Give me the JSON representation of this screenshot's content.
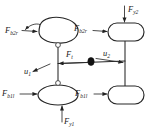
{
  "diagram": {
    "type": "free-body-diagram",
    "title": "",
    "background_color": "#ffffff",
    "line_color": "#262626",
    "label_color": "#1a1a1a",
    "bodies": [
      {
        "id": "top-left-body",
        "name": "upper left link body",
        "cx": 58,
        "cy": 32,
        "rx": 20,
        "ry": 11
      },
      {
        "id": "bottom-left-body",
        "name": "lower left link body",
        "cx": 58,
        "cy": 95,
        "rx": 20,
        "ry": 10
      },
      {
        "id": "top-right-body",
        "name": "upper right link body",
        "cx": 126,
        "cy": 32,
        "rx": 18,
        "ry": 9
      },
      {
        "id": "bottom-right-body",
        "name": "lower right link body",
        "cx": 126,
        "cy": 95,
        "rx": 18,
        "ry": 9
      }
    ],
    "joints": [
      {
        "id": "joint-upper",
        "kind": "revolute-open",
        "cx": 58,
        "cy": 45
      },
      {
        "id": "joint-lower",
        "kind": "revolute-open",
        "cx": 58,
        "cy": 83
      },
      {
        "id": "joint-pivot",
        "kind": "pin-filled",
        "cx": 91,
        "cy": 61
      }
    ],
    "labels": {
      "force_b2r_left": {
        "base": "F",
        "sub": "b2r",
        "x": 5,
        "y": 33
      },
      "force_b1l_left": {
        "base": "F",
        "sub": "b1l",
        "x": 3,
        "y": 96
      },
      "force_b2r_right": {
        "base": "F",
        "sub": "b2r",
        "x": 74,
        "y": 31
      },
      "force_b1l_right": {
        "base": "F",
        "sub": "b1l",
        "x": 75,
        "y": 96
      },
      "force_y2_top": {
        "base": "F",
        "sub": "y2",
        "x": 129,
        "y": 11
      },
      "force_y1_bottom": {
        "base": "F",
        "sub": "y1",
        "x": 62,
        "y": 124
      },
      "force_t_center": {
        "base": "F",
        "sub": "t",
        "x": 66,
        "y": 56
      },
      "disp_u1": {
        "base": "u",
        "sub": "1",
        "x": 24,
        "y": 73
      },
      "disp_u2": {
        "base": "u",
        "sub": "2",
        "x": 104,
        "y": 56
      }
    },
    "vectors": [
      {
        "name": "F_b2r-left-arrow",
        "from": [
          22,
          31
        ],
        "to": [
          37,
          32
        ],
        "direction": "right"
      },
      {
        "name": "F_b1l-left-arrow",
        "from": [
          20,
          94
        ],
        "to": [
          37,
          94
        ],
        "direction": "right"
      },
      {
        "name": "F_b2r-right-arrow",
        "from": [
          93,
          30
        ],
        "to": [
          108,
          31
        ],
        "direction": "right"
      },
      {
        "name": "F_b1l-right-arrow",
        "from": [
          94,
          94
        ],
        "to": [
          108,
          94
        ],
        "direction": "right"
      },
      {
        "name": "F_y2-down-arrow",
        "from": [
          124,
          7
        ],
        "to": [
          124,
          23
        ],
        "direction": "down"
      },
      {
        "name": "F_y1-up-arrow",
        "from": [
          62,
          122
        ],
        "to": [
          62,
          105
        ],
        "direction": "up"
      },
      {
        "name": "F_t-left-arrow",
        "from": [
          88,
          62
        ],
        "to": [
          58,
          63
        ],
        "direction": "left"
      },
      {
        "name": "u1-arrow",
        "from": [
          50,
          64
        ],
        "to": [
          32,
          72
        ],
        "direction": "down-left"
      },
      {
        "name": "u2-arrow",
        "from": [
          95,
          59
        ],
        "to": [
          124,
          63
        ],
        "direction": "right"
      }
    ],
    "links": [
      {
        "name": "left-vertical-link",
        "from": [
          58,
          43
        ],
        "to": [
          58,
          85
        ]
      },
      {
        "name": "right-vertical-link",
        "from": [
          125,
          41
        ],
        "to": [
          125,
          86
        ]
      },
      {
        "name": "horizontal-link",
        "from": [
          58,
          63
        ],
        "to": [
          125,
          61
        ]
      },
      {
        "name": "top-left-moment-tail",
        "from": [
          40,
          24
        ],
        "to": [
          24,
          31
        ]
      }
    ]
  }
}
